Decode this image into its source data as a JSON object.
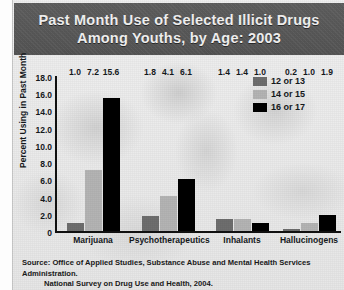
{
  "title": {
    "line1": "Past Month Use of Selected Illicit Drugs",
    "line2": "Among Youths, by Age: 2003"
  },
  "source": {
    "line1": "Source: Office of Applied Studies, Substance Abuse and Mental Health Services Administration.",
    "line2": "National Survey on Drug Use and Health, 2004."
  },
  "colors": {
    "band": "#575757",
    "series_12_13": "#6e6e6e",
    "series_14_15": "#b4b4b4",
    "series_16_17": "#000000",
    "axis": "#111111",
    "text": "#15191c"
  },
  "chart_data": {
    "type": "bar",
    "title": "Past Month Use of Selected Illicit Drugs Among Youths, by Age: 2003",
    "xlabel": "",
    "ylabel": "Percent Using in Past Month",
    "ylim": [
      0,
      18
    ],
    "yticks": [
      "18.0",
      "16.0",
      "14.0",
      "12.0",
      "10.0",
      "8.0",
      "6.0",
      "4.0",
      "2.0",
      "0"
    ],
    "ytick_values": [
      18,
      16,
      14,
      12,
      10,
      8,
      6,
      4,
      2,
      0
    ],
    "grid": false,
    "legend_position": "top-right",
    "categories": [
      "Marijuana",
      "Psychotherapeutics",
      "Inhalants",
      "Hallucinogens"
    ],
    "series": [
      {
        "name": "12 or 13",
        "color": "#6e6e6e",
        "values": [
          1.0,
          1.8,
          1.4,
          0.2
        ],
        "labels": [
          "1.0",
          "1.8",
          "1.4",
          "0.2"
        ]
      },
      {
        "name": "14 or 15",
        "color": "#b4b4b4",
        "values": [
          7.2,
          4.1,
          1.4,
          1.0
        ],
        "labels": [
          "7.2",
          "4.1",
          "1.4",
          "1.0"
        ]
      },
      {
        "name": "16 or 17",
        "color": "#000000",
        "values": [
          15.6,
          6.1,
          1.0,
          1.9
        ],
        "labels": [
          "15.6",
          "6.1",
          "1.0",
          "1.9"
        ]
      }
    ]
  }
}
